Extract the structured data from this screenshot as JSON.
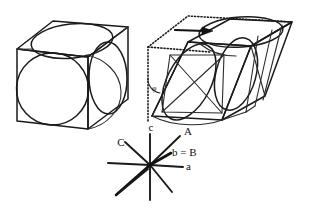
{
  "figure": {
    "background_color": "#ffffff",
    "line_color": "#1a1a1a",
    "panels": [
      {
        "id": "left-cell",
        "name": "undeformed-cubic-cell",
        "description": "Cube drawn in oblique projection with a circle inscribed on the front face, an ellipse on the top face and an ellipse on the right face, representing spheres inscribed in the cubic unit cell."
      },
      {
        "id": "right-cell",
        "name": "sheared-cell",
        "description": "Same cell after a shear deformation, drawn as a parallelepiped; the inscribed sphere becomes an ellipsoid shown with its principal-axis cross. A dotted outline marks the original undeformed cell position and a bold arrow marks the shear direction."
      },
      {
        "id": "axes",
        "name": "crystallographic-axis-star",
        "description": "Eight-ray axis star comparing the axes of the original cell (lower-case) with the axes of the sheared cell (upper-case)."
      }
    ]
  },
  "annotations": {
    "shear_arrow": {
      "name": "shear-direction-arrow",
      "label": ""
    },
    "dotted_outline": {
      "name": "original-cell-outline",
      "label": ""
    },
    "shear_angle": {
      "name": "shear-angle-marker",
      "label": "φ"
    }
  },
  "axes": {
    "center": {
      "x": 150,
      "y": 165
    },
    "labels": [
      {
        "id": "c",
        "text": "c",
        "x": 151,
        "y": 131,
        "anchor": "middle",
        "name": "axis-label-c"
      },
      {
        "id": "A",
        "text": "A",
        "x": 184,
        "y": 135,
        "anchor": "start",
        "name": "axis-label-A"
      },
      {
        "id": "bB",
        "text": "b = B",
        "x": 172,
        "y": 156,
        "anchor": "start",
        "name": "axis-label-b-equals-B"
      },
      {
        "id": "a",
        "text": "a",
        "x": 186,
        "y": 170,
        "anchor": "start",
        "name": "axis-label-a"
      },
      {
        "id": "C",
        "text": "C",
        "x": 121,
        "y": 146,
        "anchor": "middle",
        "name": "axis-label-C"
      }
    ],
    "rays": [
      {
        "id": "c-up",
        "name": "axis-ray-c-positive",
        "x2": 150,
        "y2": 134,
        "bold": false
      },
      {
        "id": "c-down",
        "name": "axis-ray-c-negative",
        "x2": 150,
        "y2": 200,
        "bold": false
      },
      {
        "id": "a-right",
        "name": "axis-ray-a-positive",
        "x2": 183,
        "y2": 167,
        "bold": false
      },
      {
        "id": "a-left",
        "name": "axis-ray-a-negative",
        "x2": 108,
        "y2": 163,
        "bold": false
      },
      {
        "id": "A-upright",
        "name": "axis-ray-A-positive",
        "x2": 180,
        "y2": 136,
        "bold": false
      },
      {
        "id": "A-downleft",
        "name": "axis-ray-A-negative",
        "x2": 116,
        "y2": 195,
        "bold": true
      },
      {
        "id": "C-upleft",
        "name": "axis-ray-C-positive",
        "x2": 125,
        "y2": 142,
        "bold": false
      },
      {
        "id": "C-downright",
        "name": "axis-ray-C-negative",
        "x2": 172,
        "y2": 192,
        "bold": false
      },
      {
        "id": "bB-ray",
        "name": "axis-ray-b-equals-B",
        "x2": 171,
        "y2": 153,
        "bold": true
      }
    ]
  }
}
